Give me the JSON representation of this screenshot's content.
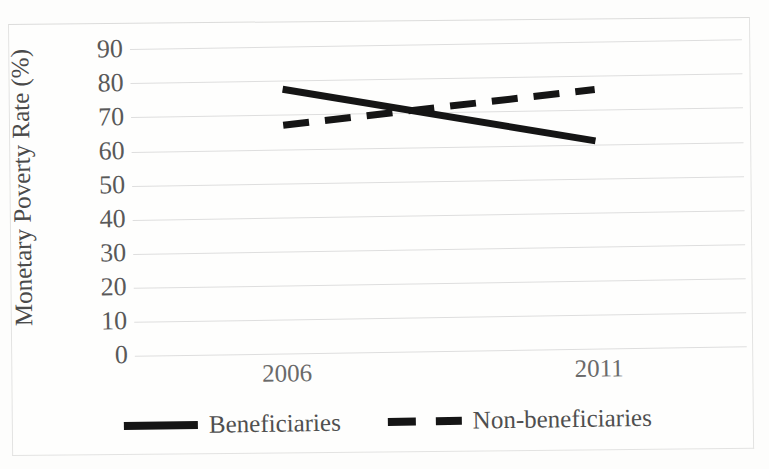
{
  "chart_data": {
    "type": "line",
    "title": "",
    "xlabel": "",
    "ylabel": "Monetary Poverty Rate (%)",
    "categories": [
      "2006",
      "2011"
    ],
    "x": [
      2006,
      2011
    ],
    "ylim": [
      0,
      90
    ],
    "ytick_step": 10,
    "yticks": [
      "90",
      "80",
      "70",
      "60",
      "50",
      "40",
      "30",
      "20",
      "10",
      "0"
    ],
    "xticks": [
      "2006",
      "2011"
    ],
    "grid": "horizontal",
    "legend_position": "bottom",
    "series": [
      {
        "name": "Beneficiaries",
        "style": "solid",
        "color": "#151515",
        "values": [
          77.5,
          61.0
        ]
      },
      {
        "name": "Non-beneficiaries",
        "style": "dashed",
        "color": "#151515",
        "values": [
          67.0,
          76.0
        ]
      }
    ],
    "annotations": []
  },
  "axes": {
    "y_label": "Monetary Poverty Rate (%)",
    "y_ticks": [
      "90",
      "80",
      "70",
      "60",
      "50",
      "40",
      "30",
      "20",
      "10",
      "0"
    ],
    "x_ticks": [
      "2006",
      "2011"
    ]
  },
  "legend": {
    "items": [
      {
        "label": "Beneficiaries",
        "style": "solid"
      },
      {
        "label": "Non-beneficiaries",
        "style": "dashed"
      }
    ]
  },
  "colors": {
    "series": "#151515",
    "grid": "#dedede",
    "tick_text": "#595959",
    "axis_label": "#4a4a4a",
    "frame": "#e3e3e2",
    "background": "#fdfdfc"
  }
}
